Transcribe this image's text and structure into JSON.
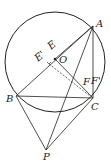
{
  "labels": {
    "A": "A",
    "B": "B",
    "C": "C",
    "P": "P",
    "O": "O",
    "E": "E",
    "Eprime": "E'",
    "F": "F",
    "Fprime": "F'"
  },
  "colors": {
    "stroke": "#222222",
    "background": "#ffffff"
  }
}
